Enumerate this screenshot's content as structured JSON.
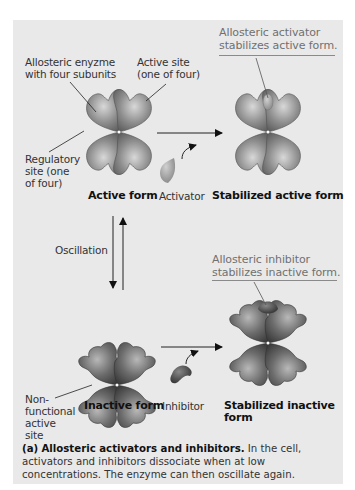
{
  "figure": {
    "background_color": "#e9e9e9",
    "labels": {
      "enzyme": "Allosteric enyzme\nwith four subunits",
      "enzyme_line1": "Allosteric enyzme",
      "enzyme_line2": "with four subunits",
      "active_site_line1": "Active site",
      "active_site_line2": "(one of four)",
      "regulatory_line1": "Regulatory",
      "regulatory_line2": "site (one",
      "regulatory_line3": "of four)",
      "active_form": "Active form",
      "activator": "Activator",
      "stabilized_active_form": "Stabilized active form",
      "oscillation": "Oscillation",
      "inactive_form": "Inactive form",
      "inhibitor": "Inhibitor",
      "stabilized_inactive_line1": "Stabilized inactive",
      "stabilized_inactive_line2": "form",
      "nonfunctional_line1": "Non-",
      "nonfunctional_line2": "functional",
      "nonfunctional_line3": "active",
      "nonfunctional_line4": "site"
    },
    "callouts": {
      "activator_line1": "Allosteric activator",
      "activator_line2": "stabilizes active form.",
      "inhibitor_line1": "Allosteric inhibitor",
      "inhibitor_line2": "stabilizes inactive form."
    },
    "caption": {
      "tag": "(a)",
      "title": "Allosteric activators and inhibitors.",
      "text": " In the cell, activators and inhibitors dissociate when at low concentrations. The enzyme can then oscillate again."
    },
    "colors": {
      "callout_text": "#707070",
      "subunit_fill": "#8c8c8c",
      "activator_fill": "#a8a8a8",
      "inhibitor_fill": "#555555"
    }
  }
}
